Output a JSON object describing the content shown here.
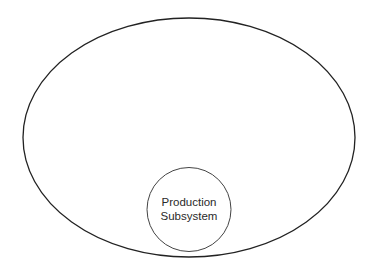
{
  "diagram": {
    "outer_system": {
      "shape": "ellipse",
      "cx": 189,
      "cy": 137.5,
      "rx": 166,
      "ry": 119.5,
      "stroke": "#222222",
      "label": ""
    },
    "subsystem": {
      "shape": "circle",
      "cx": 189,
      "cy": 209.5,
      "r": 42,
      "stroke": "#444444",
      "label_lines": [
        "Production",
        "Subsystem"
      ]
    }
  }
}
